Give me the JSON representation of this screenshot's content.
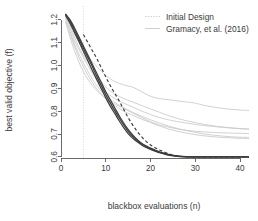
{
  "chart_data": {
    "type": "line",
    "title": "",
    "xlabel": "blackbox evaluations (n)",
    "ylabel": "best valid objective (f)",
    "xlim": [
      0,
      42
    ],
    "ylim": [
      0.595,
      1.225
    ],
    "xticks": [
      "0",
      "10",
      "20",
      "30",
      "40"
    ],
    "xtick_values": [
      0,
      10,
      20,
      30,
      40
    ],
    "yticks": [
      "0.6",
      "0.7",
      "0.8",
      "0.9",
      "1.0",
      "1.1",
      "1.2"
    ],
    "ytick_values": [
      0.6,
      0.7,
      0.8,
      0.9,
      1.0,
      1.1,
      1.2
    ],
    "grid": false,
    "legend_position": "top-right",
    "legend": [
      {
        "label": "Initial Design",
        "style": "dotted",
        "color": "#c9c9c9"
      },
      {
        "label": "Gramacy, et al. (2016)",
        "style": "solid",
        "color": "#c9c9c9"
      }
    ],
    "annotations": [
      {
        "name": "initial-design-marker",
        "type": "vline",
        "x": 5,
        "style": "dotted",
        "color": "#d2d2d2"
      }
    ],
    "series": [
      {
        "name": "Gramacy et al. (2016) run 1",
        "group": "reference",
        "color": "#c9c9c9",
        "style": "solid",
        "x": [
          1,
          2,
          3,
          4,
          5,
          6,
          7,
          8,
          9,
          10,
          12,
          14,
          16,
          18,
          20,
          22,
          24,
          26,
          28,
          30,
          32,
          34,
          36,
          38,
          40,
          42
        ],
        "y": [
          1.225,
          1.19,
          1.14,
          1.1,
          1.065,
          1.04,
          1.015,
          0.995,
          0.975,
          0.955,
          0.93,
          0.915,
          0.905,
          0.885,
          0.865,
          0.855,
          0.85,
          0.845,
          0.84,
          0.835,
          0.825,
          0.818,
          0.812,
          0.808,
          0.805,
          0.803
        ]
      },
      {
        "name": "Gramacy et al. (2016) run 2",
        "group": "reference",
        "color": "#c9c9c9",
        "style": "solid",
        "x": [
          1,
          2,
          3,
          4,
          5,
          6,
          7,
          8,
          9,
          10,
          12,
          14,
          16,
          18,
          20,
          22,
          24,
          26,
          28,
          30,
          32,
          34,
          36,
          38,
          40,
          42
        ],
        "y": [
          1.225,
          1.18,
          1.125,
          1.08,
          1.045,
          1.015,
          0.985,
          0.955,
          0.93,
          0.905,
          0.875,
          0.855,
          0.84,
          0.825,
          0.81,
          0.795,
          0.78,
          0.768,
          0.758,
          0.75,
          0.742,
          0.736,
          0.731,
          0.727,
          0.724,
          0.722
        ]
      },
      {
        "name": "Gramacy et al. (2016) run 3",
        "group": "reference",
        "color": "#c9c9c9",
        "style": "solid",
        "x": [
          1,
          2,
          3,
          4,
          5,
          6,
          7,
          8,
          9,
          10,
          12,
          14,
          16,
          18,
          20,
          22,
          24,
          26,
          28,
          30,
          32,
          34,
          36,
          38,
          40,
          42
        ],
        "y": [
          1.215,
          1.165,
          1.11,
          1.07,
          1.035,
          1.0,
          0.965,
          0.935,
          0.908,
          0.885,
          0.855,
          0.835,
          0.818,
          0.8,
          0.785,
          0.772,
          0.762,
          0.754,
          0.748,
          0.742,
          0.737,
          0.733,
          0.729,
          0.726,
          0.723,
          0.721
        ]
      },
      {
        "name": "Gramacy et al. (2016) run 4",
        "group": "reference",
        "color": "#c9c9c9",
        "style": "solid",
        "x": [
          1,
          2,
          3,
          4,
          5,
          6,
          7,
          8,
          9,
          10,
          12,
          14,
          16,
          18,
          20,
          22,
          24,
          26,
          28,
          30,
          32,
          34,
          36,
          38,
          40,
          42
        ],
        "y": [
          1.21,
          1.15,
          1.095,
          1.05,
          1.01,
          0.975,
          0.94,
          0.912,
          0.888,
          0.868,
          0.838,
          0.815,
          0.795,
          0.778,
          0.762,
          0.748,
          0.735,
          0.724,
          0.715,
          0.707,
          0.7,
          0.695,
          0.691,
          0.688,
          0.686,
          0.685
        ]
      },
      {
        "name": "Gramacy et al. (2016) run 5",
        "group": "reference",
        "color": "#c9c9c9",
        "style": "solid",
        "x": [
          1,
          2,
          3,
          4,
          5,
          6,
          7,
          8,
          9,
          10,
          12,
          14,
          16,
          18,
          20,
          22,
          24,
          26,
          28,
          30,
          32,
          34,
          36,
          38,
          40,
          42
        ],
        "y": [
          1.2,
          1.14,
          1.085,
          1.035,
          0.995,
          0.958,
          0.925,
          0.898,
          0.875,
          0.855,
          0.825,
          0.8,
          0.782,
          0.765,
          0.75,
          0.735,
          0.722,
          0.712,
          0.704,
          0.697,
          0.692,
          0.688,
          0.685,
          0.683,
          0.681,
          0.68
        ]
      },
      {
        "name": "Gramacy et al. (2016) run 6",
        "group": "reference",
        "color": "#c9c9c9",
        "style": "solid",
        "x": [
          1,
          2,
          3,
          4,
          5,
          6,
          7,
          8,
          9,
          10,
          12,
          14,
          16,
          18,
          20,
          22,
          24,
          26,
          28,
          30,
          32,
          34,
          36,
          38,
          40,
          42
        ],
        "y": [
          1.19,
          1.125,
          1.065,
          1.015,
          0.972,
          0.94,
          0.912,
          0.89,
          0.872,
          0.856,
          0.832,
          0.812,
          0.792,
          0.772,
          0.754,
          0.74,
          0.73,
          0.722,
          0.716,
          0.712,
          0.709,
          0.707,
          0.705,
          0.704,
          0.703,
          0.702
        ]
      },
      {
        "name": "proposed run 1",
        "group": "new",
        "color": "#3d3d3d",
        "style": "solid",
        "x": [
          1,
          2,
          3,
          4,
          5,
          6,
          7,
          8,
          9,
          10,
          11,
          12,
          13,
          14,
          15,
          16,
          17,
          18,
          19,
          20,
          21,
          22,
          23,
          24,
          25,
          26,
          28,
          30,
          34,
          38,
          42
        ],
        "y": [
          1.225,
          1.2,
          1.165,
          1.125,
          1.085,
          1.045,
          1.005,
          0.965,
          0.925,
          0.885,
          0.85,
          0.815,
          0.78,
          0.748,
          0.72,
          0.696,
          0.676,
          0.66,
          0.648,
          0.638,
          0.63,
          0.622,
          0.616,
          0.611,
          0.607,
          0.604,
          0.601,
          0.6,
          0.6,
          0.6,
          0.6
        ]
      },
      {
        "name": "proposed run 2",
        "group": "new",
        "color": "#3d3d3d",
        "style": "solid",
        "x": [
          1,
          2,
          3,
          4,
          5,
          6,
          7,
          8,
          9,
          10,
          11,
          12,
          13,
          14,
          15,
          16,
          17,
          18,
          19,
          20,
          21,
          22,
          23,
          24,
          25,
          26,
          28,
          30,
          34,
          38,
          42
        ],
        "y": [
          1.225,
          1.195,
          1.155,
          1.115,
          1.075,
          1.035,
          0.995,
          0.952,
          0.912,
          0.872,
          0.836,
          0.802,
          0.77,
          0.74,
          0.712,
          0.69,
          0.672,
          0.657,
          0.645,
          0.635,
          0.627,
          0.62,
          0.614,
          0.609,
          0.605,
          0.602,
          0.6,
          0.6,
          0.6,
          0.6,
          0.6
        ]
      },
      {
        "name": "proposed run 3",
        "group": "new",
        "color": "#3d3d3d",
        "style": "solid",
        "x": [
          1,
          2,
          3,
          4,
          5,
          6,
          7,
          8,
          9,
          10,
          11,
          12,
          13,
          14,
          15,
          16,
          17,
          18,
          19,
          20,
          21,
          22,
          23,
          24,
          25,
          26,
          28,
          30,
          34,
          38,
          42
        ],
        "y": [
          1.22,
          1.185,
          1.145,
          1.105,
          1.062,
          1.02,
          0.978,
          0.938,
          0.898,
          0.858,
          0.822,
          0.79,
          0.758,
          0.728,
          0.702,
          0.682,
          0.666,
          0.652,
          0.641,
          0.632,
          0.625,
          0.618,
          0.613,
          0.608,
          0.605,
          0.602,
          0.6,
          0.6,
          0.6,
          0.6,
          0.6
        ]
      },
      {
        "name": "proposed run 4 (dashed)",
        "group": "new",
        "color": "#3d3d3d",
        "style": "dashed",
        "x": [
          5,
          6,
          7,
          8,
          9,
          10,
          11,
          12,
          13,
          14,
          15,
          16,
          17,
          18,
          19,
          20,
          21,
          22,
          23,
          24,
          25,
          26,
          28,
          30,
          34,
          38,
          42
        ],
        "y": [
          1.135,
          1.1,
          1.065,
          1.03,
          0.99,
          0.95,
          0.912,
          0.878,
          0.845,
          0.808,
          0.772,
          0.74,
          0.712,
          0.688,
          0.668,
          0.652,
          0.64,
          0.63,
          0.622,
          0.614,
          0.608,
          0.604,
          0.601,
          0.6,
          0.6,
          0.6,
          0.6
        ]
      }
    ]
  }
}
